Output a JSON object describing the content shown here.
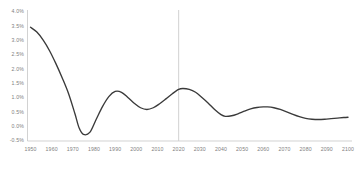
{
  "chart_data": {
    "type": "line",
    "title": "",
    "subtitle": "",
    "xlabel": "",
    "ylabel": "",
    "xlim": [
      1950,
      2100
    ],
    "ylim": [
      -0.5,
      4.0
    ],
    "grid": false,
    "legend": "none",
    "y_tick_labels": [
      "4.0%",
      "3.5%",
      "3.0%",
      "2.5%",
      "2.0%",
      "1.5%",
      "1.0%",
      "0.5%",
      "0.0%",
      "-0.5%"
    ],
    "y_tick_values": [
      4.0,
      3.5,
      3.0,
      2.5,
      2.0,
      1.5,
      1.0,
      0.5,
      0.0,
      -0.5
    ],
    "x_tick_labels": [
      "1950",
      "1960",
      "1970",
      "1980",
      "1990",
      "2000",
      "2010",
      "2020",
      "2030",
      "2040",
      "2050",
      "2060",
      "2070",
      "2080",
      "2090",
      "2100"
    ],
    "x_tick_values": [
      1950,
      1960,
      1970,
      1980,
      1990,
      2000,
      2010,
      2020,
      2030,
      2040,
      2050,
      2060,
      2070,
      2080,
      2090,
      2100
    ],
    "series": [
      {
        "name": "growth-rate",
        "color": "#3a3a3a",
        "x": [
          1950,
          1953,
          1956,
          1959,
          1962,
          1965,
          1968,
          1971,
          1973,
          1975,
          1978,
          1981,
          1984,
          1987,
          1990,
          1993,
          1996,
          1999,
          2002,
          2005,
          2008,
          2011,
          2014,
          2017,
          2020,
          2022,
          2025,
          2028,
          2031,
          2034,
          2037,
          2040,
          2042,
          2045,
          2048,
          2051,
          2054,
          2057,
          2060,
          2062,
          2065,
          2068,
          2071,
          2074,
          2077,
          2080,
          2083,
          2086,
          2089,
          2092,
          2095,
          2098,
          2100
        ],
        "y": [
          3.47,
          3.3,
          3.02,
          2.65,
          2.2,
          1.7,
          1.15,
          0.45,
          -0.05,
          -0.27,
          -0.2,
          0.25,
          0.7,
          1.05,
          1.23,
          1.2,
          1.02,
          0.82,
          0.66,
          0.6,
          0.66,
          0.8,
          0.97,
          1.15,
          1.3,
          1.33,
          1.3,
          1.2,
          1.02,
          0.82,
          0.6,
          0.42,
          0.36,
          0.38,
          0.45,
          0.54,
          0.62,
          0.67,
          0.69,
          0.69,
          0.66,
          0.6,
          0.52,
          0.43,
          0.35,
          0.29,
          0.26,
          0.25,
          0.26,
          0.28,
          0.3,
          0.32,
          0.33
        ]
      }
    ],
    "annotations": [
      {
        "name": "present-year-marker",
        "type": "vertical-line",
        "x": 2020,
        "color": "#cccccc"
      }
    ]
  },
  "axes": {
    "axis_color": "#bfbfbf",
    "tick_label_color": "#808080"
  }
}
